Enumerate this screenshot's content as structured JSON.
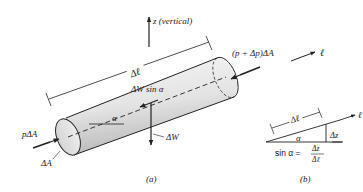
{
  "labels": {
    "z_axis": "z (vertical)",
    "delta_l": "Δℓ",
    "end_force": "(p + Δp)ΔA",
    "l_axis": "ℓ",
    "weight_component": "ΔW sin α",
    "alpha": "α",
    "p_force": "pΔA",
    "weight": "ΔW",
    "area": "ΔA",
    "caption_a": "(a)"
  },
  "inset": {
    "delta_l": "Δℓ",
    "l_axis": "ℓ",
    "alpha": "α",
    "delta_z": "Δz",
    "formula_lhs": "sin α =",
    "formula_num": "Δz",
    "formula_den": "Δℓ",
    "caption_b": "(b)"
  },
  "colors": {
    "line": "#222222",
    "cylinder_light": "#f2f2f2",
    "cylinder_dark": "#bdbdbd"
  }
}
